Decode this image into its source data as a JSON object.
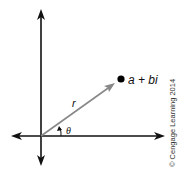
{
  "diagram": {
    "point_label": "a + bi",
    "radius_label": "r",
    "angle_label": "θ",
    "copyright": "© Cengage Learning 2014",
    "colors": {
      "axes": "#111111",
      "vector": "#888888",
      "point": "#000000"
    }
  }
}
